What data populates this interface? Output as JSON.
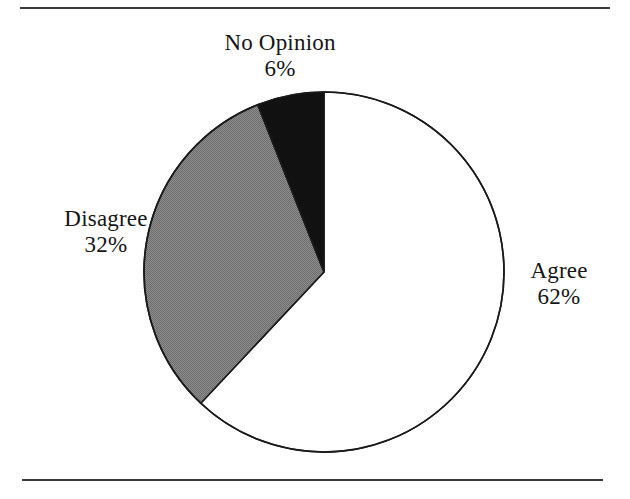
{
  "figure": {
    "background_color": "#ffffff",
    "rule_color": "#3a3a3a",
    "has_top_rule": true,
    "has_bottom_rule": true
  },
  "chart_data": {
    "type": "pie",
    "title": "",
    "subtitle": "",
    "xlabel": "",
    "ylabel": "",
    "legend_position": "none",
    "grid": false,
    "start_angle_deg": 0,
    "direction": "clockwise",
    "center": {
      "x": 324,
      "y": 272
    },
    "radius": 180,
    "labels": [
      "Agree",
      "Disagree",
      "No Opinion"
    ],
    "values": [
      62,
      32,
      6
    ],
    "value_suffix": "%",
    "slices": [
      {
        "name": "Agree",
        "value": 62,
        "value_text": "62%",
        "fill": "#ffffff",
        "fill_style": "solid",
        "stroke": "#1a1a1a",
        "start_angle_deg": 0,
        "end_angle_deg": 223.2,
        "label_position": "right"
      },
      {
        "name": "Disagree",
        "value": 32,
        "value_text": "32%",
        "fill": "#808080",
        "fill_style": "halftone",
        "stroke": "#1a1a1a",
        "start_angle_deg": 223.2,
        "end_angle_deg": 338.4,
        "label_position": "left"
      },
      {
        "name": "No Opinion",
        "value": 6,
        "value_text": "6%",
        "fill": "#111111",
        "fill_style": "solid",
        "stroke": "#1a1a1a",
        "start_angle_deg": 338.4,
        "end_angle_deg": 360.0,
        "label_position": "top"
      }
    ]
  },
  "labels": {
    "no_opinion": {
      "name": "No Opinion",
      "percent": "6%"
    },
    "disagree": {
      "name": "Disagree",
      "percent": "32%"
    },
    "agree": {
      "name": "Agree",
      "percent": "62%"
    }
  }
}
